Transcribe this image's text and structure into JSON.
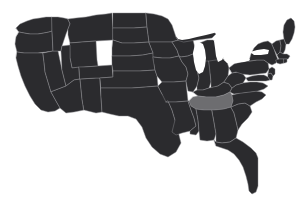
{
  "map": {
    "title": "United States choropleth map",
    "type": "choropleth",
    "projection": "albers-usa",
    "background_color": "#ffffff",
    "default_state_fill": "#2b2b2e",
    "highlight_state_fill": "#6d6d70",
    "border_color": "#8e8e92",
    "lake_fill": "#ffffff",
    "highlighted_states": [
      "Tennessee"
    ],
    "legend_visible": false,
    "labels_visible": false,
    "states": [
      {
        "code": "WA",
        "name": "Washington",
        "highlighted": false
      },
      {
        "code": "OR",
        "name": "Oregon",
        "highlighted": false
      },
      {
        "code": "CA",
        "name": "California",
        "highlighted": false
      },
      {
        "code": "NV",
        "name": "Nevada",
        "highlighted": false
      },
      {
        "code": "ID",
        "name": "Idaho",
        "highlighted": false
      },
      {
        "code": "MT",
        "name": "Montana",
        "highlighted": false
      },
      {
        "code": "WY",
        "name": "Wyoming",
        "highlighted": false
      },
      {
        "code": "UT",
        "name": "Utah",
        "highlighted": false
      },
      {
        "code": "AZ",
        "name": "Arizona",
        "highlighted": false
      },
      {
        "code": "NM",
        "name": "New Mexico",
        "highlighted": false
      },
      {
        "code": "CO",
        "name": "Colorado",
        "highlighted": false
      },
      {
        "code": "ND",
        "name": "North Dakota",
        "highlighted": false
      },
      {
        "code": "SD",
        "name": "South Dakota",
        "highlighted": false
      },
      {
        "code": "NE",
        "name": "Nebraska",
        "highlighted": false
      },
      {
        "code": "KS",
        "name": "Kansas",
        "highlighted": false
      },
      {
        "code": "OK",
        "name": "Oklahoma",
        "highlighted": false
      },
      {
        "code": "TX",
        "name": "Texas",
        "highlighted": false
      },
      {
        "code": "MN",
        "name": "Minnesota",
        "highlighted": false
      },
      {
        "code": "IA",
        "name": "Iowa",
        "highlighted": false
      },
      {
        "code": "MO",
        "name": "Missouri",
        "highlighted": false
      },
      {
        "code": "AR",
        "name": "Arkansas",
        "highlighted": false
      },
      {
        "code": "LA",
        "name": "Louisiana",
        "highlighted": false
      },
      {
        "code": "WI",
        "name": "Wisconsin",
        "highlighted": false
      },
      {
        "code": "IL",
        "name": "Illinois",
        "highlighted": false
      },
      {
        "code": "MI",
        "name": "Michigan",
        "highlighted": false
      },
      {
        "code": "IN",
        "name": "Indiana",
        "highlighted": false
      },
      {
        "code": "OH",
        "name": "Ohio",
        "highlighted": false
      },
      {
        "code": "KY",
        "name": "Kentucky",
        "highlighted": false
      },
      {
        "code": "TN",
        "name": "Tennessee",
        "highlighted": true
      },
      {
        "code": "MS",
        "name": "Mississippi",
        "highlighted": false
      },
      {
        "code": "AL",
        "name": "Alabama",
        "highlighted": false
      },
      {
        "code": "GA",
        "name": "Georgia",
        "highlighted": false
      },
      {
        "code": "FL",
        "name": "Florida",
        "highlighted": false
      },
      {
        "code": "SC",
        "name": "South Carolina",
        "highlighted": false
      },
      {
        "code": "NC",
        "name": "North Carolina",
        "highlighted": false
      },
      {
        "code": "VA",
        "name": "Virginia",
        "highlighted": false
      },
      {
        "code": "WV",
        "name": "West Virginia",
        "highlighted": false
      },
      {
        "code": "MD",
        "name": "Maryland",
        "highlighted": false
      },
      {
        "code": "DE",
        "name": "Delaware",
        "highlighted": false
      },
      {
        "code": "NJ",
        "name": "New Jersey",
        "highlighted": false
      },
      {
        "code": "PA",
        "name": "Pennsylvania",
        "highlighted": false
      },
      {
        "code": "NY",
        "name": "New York",
        "highlighted": false
      },
      {
        "code": "CT",
        "name": "Connecticut",
        "highlighted": false
      },
      {
        "code": "RI",
        "name": "Rhode Island",
        "highlighted": false
      },
      {
        "code": "MA",
        "name": "Massachusetts",
        "highlighted": false
      },
      {
        "code": "VT",
        "name": "Vermont",
        "highlighted": false
      },
      {
        "code": "NH",
        "name": "New Hampshire",
        "highlighted": false
      },
      {
        "code": "ME",
        "name": "Maine",
        "highlighted": false
      }
    ],
    "lakes": [
      {
        "name": "Lake Superior"
      },
      {
        "name": "Lake Michigan"
      },
      {
        "name": "Lake Huron"
      },
      {
        "name": "Lake Erie"
      },
      {
        "name": "Lake Ontario"
      }
    ],
    "caption": ""
  }
}
